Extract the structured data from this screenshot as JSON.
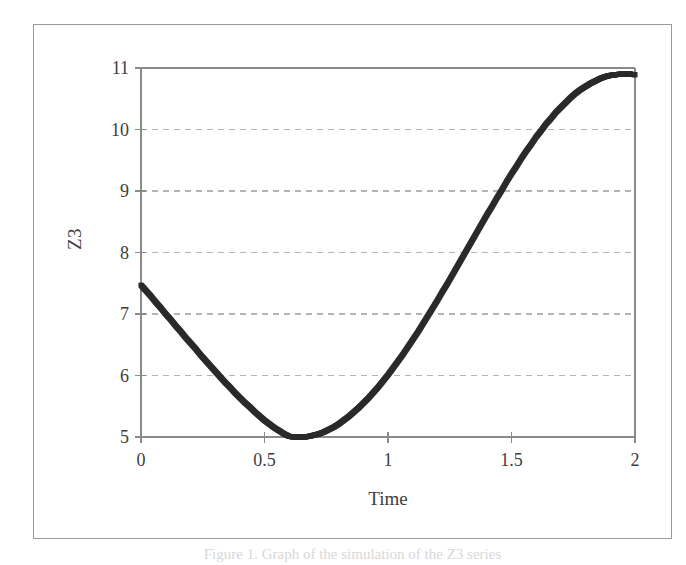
{
  "figure": {
    "caption": "Figure 1. Graph of the simulation of the Z3 series",
    "background_color": "#ffffff",
    "frame_color": "#9a9a9a"
  },
  "axis": {
    "y_title": "Z3",
    "x_title": "Time",
    "y_ticks": [
      "11",
      "10",
      "9",
      "8",
      "7",
      "6",
      "5"
    ],
    "x_ticks": [
      "0",
      "0.5",
      "1",
      "1.5",
      "2"
    ]
  },
  "chart_data": {
    "type": "scatter",
    "title": "",
    "xlabel": "Time",
    "ylabel": "Z3",
    "xlim": [
      0,
      2
    ],
    "ylim": [
      5,
      11
    ],
    "xticks": [
      0,
      0.5,
      1,
      1.5,
      2
    ],
    "yticks": [
      5,
      6,
      7,
      8,
      9,
      10,
      11
    ],
    "grid": true,
    "grid_axis": "y",
    "grid_style": "dashed",
    "grid_color": "#b4b4b4",
    "legend": false,
    "marker_color": "#2b2b2b",
    "marker_size": 5,
    "series": [
      {
        "name": "Z3",
        "x": [
          0.0,
          0.02,
          0.04,
          0.06,
          0.08,
          0.1,
          0.12,
          0.14,
          0.16,
          0.18,
          0.2,
          0.22,
          0.24,
          0.26,
          0.28,
          0.3,
          0.32,
          0.34,
          0.36,
          0.38,
          0.4,
          0.42,
          0.44,
          0.46,
          0.48,
          0.5,
          0.52,
          0.54,
          0.56,
          0.58,
          0.6,
          0.62,
          0.64,
          0.66,
          0.68,
          0.7,
          0.72,
          0.74,
          0.76,
          0.78,
          0.8,
          0.82,
          0.84,
          0.86,
          0.88,
          0.9,
          0.92,
          0.94,
          0.96,
          0.98,
          1.0,
          1.02,
          1.04,
          1.06,
          1.08,
          1.1,
          1.12,
          1.14,
          1.16,
          1.18,
          1.2,
          1.22,
          1.24,
          1.26,
          1.28,
          1.3,
          1.32,
          1.34,
          1.36,
          1.38,
          1.4,
          1.42,
          1.44,
          1.46,
          1.48,
          1.5,
          1.52,
          1.54,
          1.56,
          1.58,
          1.6,
          1.62,
          1.64,
          1.66,
          1.68,
          1.7,
          1.72,
          1.74,
          1.76,
          1.78,
          1.8,
          1.82,
          1.84,
          1.86,
          1.88,
          1.9,
          1.92,
          1.94,
          1.96,
          1.98,
          2.0
        ],
        "y": [
          7.47,
          7.38,
          7.29,
          7.19,
          7.1,
          7.0,
          6.91,
          6.81,
          6.72,
          6.62,
          6.53,
          6.44,
          6.34,
          6.25,
          6.16,
          6.07,
          5.98,
          5.89,
          5.81,
          5.72,
          5.64,
          5.56,
          5.49,
          5.41,
          5.34,
          5.27,
          5.21,
          5.15,
          5.1,
          5.05,
          5.01,
          5.0,
          5.0,
          5.0,
          5.01,
          5.03,
          5.05,
          5.08,
          5.12,
          5.16,
          5.21,
          5.27,
          5.33,
          5.4,
          5.47,
          5.55,
          5.63,
          5.72,
          5.81,
          5.91,
          6.01,
          6.12,
          6.23,
          6.34,
          6.46,
          6.58,
          6.7,
          6.83,
          6.96,
          7.09,
          7.22,
          7.36,
          7.49,
          7.63,
          7.77,
          7.91,
          8.05,
          8.19,
          8.33,
          8.47,
          8.61,
          8.74,
          8.88,
          9.01,
          9.15,
          9.28,
          9.4,
          9.53,
          9.65,
          9.76,
          9.88,
          9.98,
          10.09,
          10.18,
          10.28,
          10.36,
          10.44,
          10.52,
          10.59,
          10.65,
          10.7,
          10.75,
          10.79,
          10.83,
          10.86,
          10.88,
          10.89,
          10.9,
          10.9,
          10.9,
          10.89
        ]
      }
    ]
  }
}
